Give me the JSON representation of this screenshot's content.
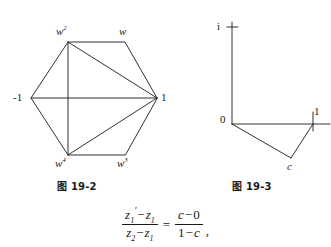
{
  "page": {
    "background_color": "#ffffff",
    "ink_color": "#1a1a1a"
  },
  "figures": [
    {
      "id": "figure-19-2",
      "caption": "图 19-2",
      "caption_prefix": "图",
      "caption_number": "19 - 2",
      "type": "hexagon-roots-of-unity",
      "description": "Regular hexagon of sixth roots of unity with diagonals drawn to vertex 1 and a vertical diagonal",
      "vertices": [
        {
          "name": "one",
          "label": "1",
          "label_style": "upright",
          "x": 157,
          "y": 98,
          "label_x": 161,
          "label_y": 92
        },
        {
          "name": "w",
          "label": "w",
          "superscript": "",
          "label_style": "italic",
          "x": 125,
          "y": 42,
          "label_x": 120,
          "label_y": 27
        },
        {
          "name": "w2",
          "label": "w",
          "superscript": "2",
          "label_style": "italic",
          "x": 68,
          "y": 42,
          "label_x": 56,
          "label_y": 27
        },
        {
          "name": "minus-one",
          "label": "-1",
          "label_style": "upright",
          "x": 31,
          "y": 98,
          "label_x": 14,
          "label_y": 92
        },
        {
          "name": "w4",
          "label": "w",
          "superscript": "4",
          "label_style": "italic",
          "x": 68,
          "y": 155,
          "label_x": 56,
          "label_y": 158
        },
        {
          "name": "w3",
          "label": "w",
          "superscript": "3",
          "label_style": "italic",
          "x": 125,
          "y": 155,
          "label_x": 118,
          "label_y": 158
        }
      ],
      "edges": [
        [
          "one",
          "w"
        ],
        [
          "w",
          "w2"
        ],
        [
          "w2",
          "minus-one"
        ],
        [
          "minus-one",
          "w4"
        ],
        [
          "w4",
          "w3"
        ],
        [
          "w3",
          "one"
        ]
      ],
      "diagonals": [
        [
          "w2",
          "one"
        ],
        [
          "w4",
          "one"
        ],
        [
          "minus-one",
          "one"
        ],
        [
          "w2",
          "w4"
        ]
      ]
    },
    {
      "id": "figure-19-3",
      "caption": "图 19-3",
      "caption_prefix": "图",
      "caption_number": "19 - 3",
      "type": "complex-plane-triangle",
      "description": "Complex plane axes with triangle 0, 1, c where c lies below the real axis",
      "axes": {
        "origin": {
          "x": 232,
          "y": 124
        },
        "vertical_top": {
          "x": 232,
          "y": 22
        },
        "horizontal_right": {
          "x": 330,
          "y": 124
        },
        "tick_i": {
          "x": 232,
          "y": 27,
          "half_width": 5
        },
        "tick_one": {
          "x": 313,
          "y": 124,
          "half_height": 6
        }
      },
      "points": [
        {
          "name": "origin",
          "label": "0",
          "label_style": "upright",
          "x": 232,
          "y": 124,
          "label_x": 221,
          "label_y": 115
        },
        {
          "name": "i",
          "label": "i",
          "label_style": "upright",
          "x": 232,
          "y": 27,
          "label_x": 218,
          "label_y": 21
        },
        {
          "name": "one",
          "label": "1",
          "label_style": "upright",
          "x": 313,
          "y": 124,
          "label_x": 314,
          "label_y": 107
        },
        {
          "name": "c",
          "label": "c",
          "label_style": "italic",
          "x": 291,
          "y": 158,
          "label_x": 288,
          "label_y": 161
        }
      ],
      "triangle_edges": [
        [
          "origin",
          "c"
        ],
        [
          "c",
          "one"
        ],
        [
          "origin",
          "one"
        ]
      ]
    }
  ],
  "formula": {
    "text": "(z1' - z1)/(z2 - z1) = (c - 0)/(1 - c),",
    "left": {
      "numerator_base": "z",
      "numerator_sub1": "1",
      "numerator_prime": "'",
      "numerator_op": "−",
      "numerator_term2_base": "z",
      "numerator_term2_sub": "1",
      "denominator_base": "z",
      "denominator_sub1": "2",
      "denominator_op": "−",
      "denominator_term2_base": "z",
      "denominator_term2_sub": "1"
    },
    "equals": "=",
    "right": {
      "numerator_c": "c",
      "numerator_op": "−",
      "numerator_zero": "0",
      "denominator_one": "1",
      "denominator_op": "−",
      "denominator_c": "c"
    },
    "trailing_punctuation": ","
  }
}
